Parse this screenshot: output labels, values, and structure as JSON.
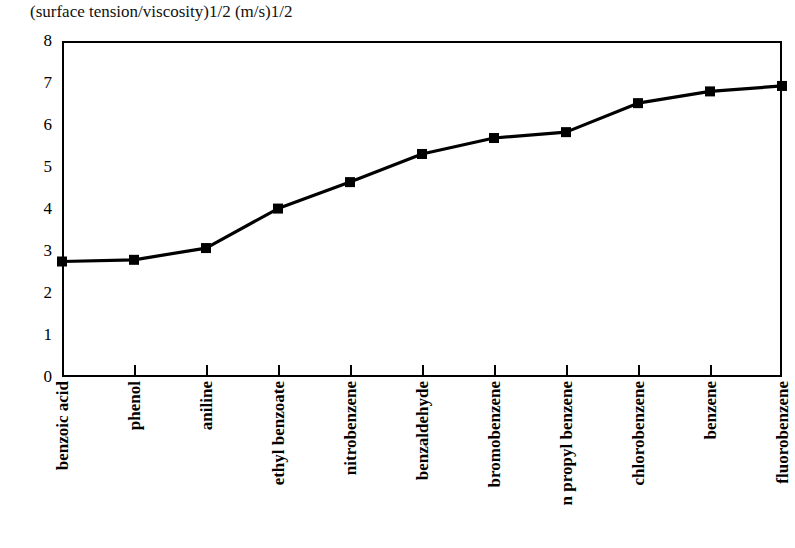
{
  "chart_data": {
    "type": "line",
    "title": "(surface tension/viscosity)1/2 (m/s)1/2",
    "xlabel": "",
    "ylabel": "",
    "ylim": [
      0,
      8
    ],
    "ytick_labels": [
      "8",
      "7",
      "6",
      "5",
      "4",
      "3",
      "2",
      "1",
      "0"
    ],
    "yticks": [
      8,
      7,
      6,
      5,
      4,
      3,
      2,
      1,
      0
    ],
    "grid": false,
    "legend": "none",
    "marker": "square",
    "line_color": "#000000",
    "marker_color": "#000000",
    "categories": [
      "benzoic acid",
      "phenol",
      "aniline",
      "ethyl benzoate",
      "nitrobenzene",
      "benzaldehyde",
      "bromobenzene",
      "n propyl benzene",
      "chlorobenzene",
      "benzene",
      "fluorobenzene"
    ],
    "values": [
      2.75,
      2.79,
      3.07,
      4.01,
      4.64,
      5.31,
      5.69,
      5.83,
      6.52,
      6.8,
      6.93
    ]
  }
}
